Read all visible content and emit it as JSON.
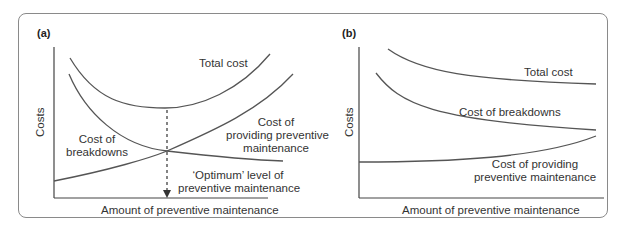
{
  "figure": {
    "panels": [
      {
        "tag": "(a)",
        "ylabel": "Costs",
        "xlabel": "Amount of preventive maintenance",
        "labels": {
          "total_cost": "Total cost",
          "cost_breakdowns_1": "Cost of",
          "cost_breakdowns_2": "breakdowns",
          "cost_providing_1": "Cost of",
          "cost_providing_2": "providing preventive",
          "cost_providing_3": "maintenance",
          "optimum_1": "‘Optimum’ level of",
          "optimum_2": "preventive maintenance"
        }
      },
      {
        "tag": "(b)",
        "ylabel": "Costs",
        "xlabel": "Amount of preventive maintenance",
        "labels": {
          "total_cost": "Total cost",
          "cost_breakdowns": "Cost of breakdowns",
          "cost_providing_1": "Cost of providing",
          "cost_providing_2": "preventive maintenance"
        }
      }
    ],
    "colors": {
      "curve": "#555555",
      "frame": "#8a8a8a",
      "text": "#333333"
    }
  }
}
